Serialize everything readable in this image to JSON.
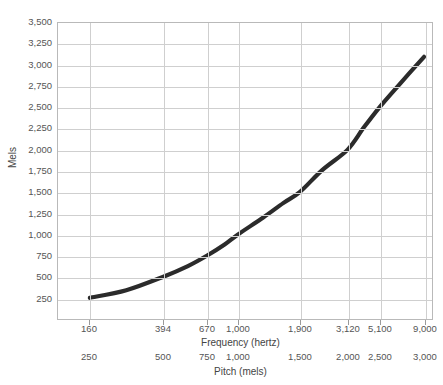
{
  "chart_data": {
    "type": "line",
    "title": "",
    "xlabel": "Frequency (hertz)",
    "ylabel": "Mels",
    "secondary_xlabel": "Pitch (mels)",
    "grid": true,
    "legend": "none",
    "ylim": [
      0,
      3500
    ],
    "y_ticks": [
      3500,
      3250,
      3000,
      2750,
      2500,
      2250,
      2000,
      1750,
      1500,
      1250,
      1000,
      750,
      500,
      250
    ],
    "y_tick_labels": [
      "3,500",
      "3,250",
      "3,000",
      "2,750",
      "2,500",
      "2,250",
      "2,000",
      "1,750",
      "1,500",
      "1,250",
      "1,000",
      "750",
      "500",
      "250"
    ],
    "x_scale": "log",
    "x_ticks_hertz": [
      160,
      394,
      670,
      1000,
      1900,
      3120,
      5100,
      9000
    ],
    "x_tick_labels_hertz": [
      "160",
      "394",
      "670",
      "1,000",
      "1,900",
      "3,120",
      "5,100",
      "9,000"
    ],
    "x_ticks_mels": [
      250,
      500,
      750,
      1000,
      1500,
      2000,
      2500,
      3000
    ],
    "x_tick_labels_mels": [
      "250",
      "500",
      "750",
      "1,000",
      "1,500",
      "2,000",
      "2,500",
      "3,000"
    ],
    "series": [
      {
        "name": "Mel scale",
        "color": "#2b2b2b",
        "line_width": 4,
        "points": [
          {
            "hz": 160,
            "mels": 250
          },
          {
            "hz": 250,
            "mels": 340
          },
          {
            "hz": 394,
            "mels": 500
          },
          {
            "hz": 530,
            "mels": 625
          },
          {
            "hz": 670,
            "mels": 750
          },
          {
            "hz": 840,
            "mels": 880
          },
          {
            "hz": 1000,
            "mels": 1000
          },
          {
            "hz": 1300,
            "mels": 1200
          },
          {
            "hz": 1600,
            "mels": 1370
          },
          {
            "hz": 1900,
            "mels": 1500
          },
          {
            "hz": 2400,
            "mels": 1760
          },
          {
            "hz": 3120,
            "mels": 2000
          },
          {
            "hz": 4000,
            "mels": 2260
          },
          {
            "hz": 5100,
            "mels": 2500
          },
          {
            "hz": 6500,
            "mels": 2760
          },
          {
            "hz": 9000,
            "mels": 3100
          }
        ]
      }
    ]
  },
  "geometry": {
    "plot_left": 57,
    "plot_top": 22,
    "plot_width": 376,
    "plot_height": 298,
    "tick_x_positions": [
      89,
      163,
      207,
      238,
      300,
      348,
      380,
      425
    ],
    "curve_path": "M 32,278 C 52,268 76,252 106,226 C 136,200 168,170 196,140 C 224,110 252,74 290,44 C 310,29 340,13 368,8"
  }
}
